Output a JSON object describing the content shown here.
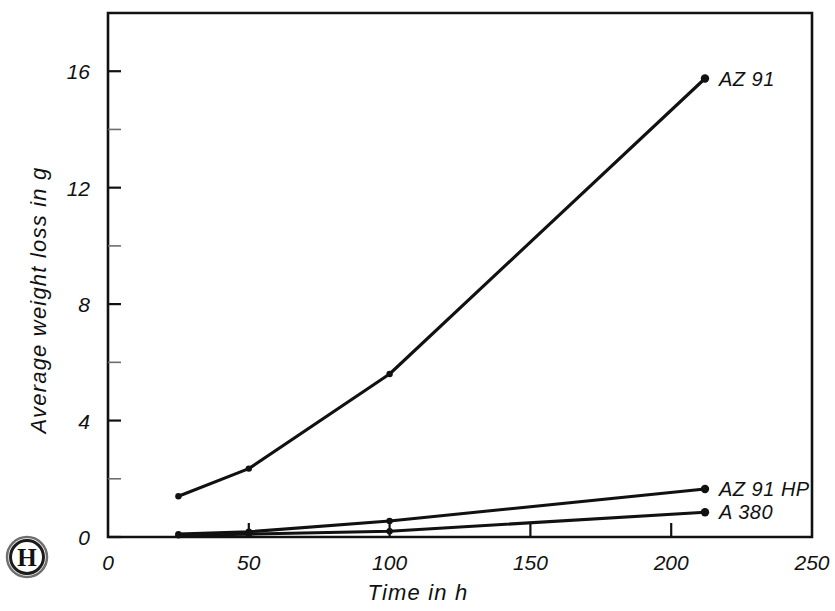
{
  "figure": {
    "background_color": "#ffffff",
    "ink_color": "#111111",
    "logo": {
      "name": "publisher-monogram",
      "letter": "H"
    }
  },
  "axes": {
    "x": {
      "title": "Time  in  h",
      "ticks": [
        "0",
        "50",
        "100",
        "150",
        "200",
        "250"
      ],
      "tick_values": [
        0,
        50,
        100,
        150,
        200,
        250
      ],
      "range": [
        0,
        250
      ]
    },
    "y": {
      "title": "Average  weight  loss  in  g",
      "ticks": [
        "0",
        "4",
        "8",
        "12",
        "16"
      ],
      "tick_values": [
        0,
        4,
        8,
        12,
        16
      ],
      "minor_tick_values": [
        2,
        6,
        10,
        14
      ],
      "range": [
        0,
        18
      ]
    }
  },
  "chart_data": {
    "type": "line",
    "title": "",
    "subtitle": "",
    "xlabel": "Time  in  h",
    "ylabel": "Average  weight  loss  in  g",
    "xlim": [
      0,
      250
    ],
    "ylim": [
      0,
      18
    ],
    "grid": false,
    "legend_position": "right-of-line-ends",
    "series": [
      {
        "name": "AZ 91",
        "label": "AZ 91",
        "color": "#111111",
        "x": [
          25,
          50,
          100,
          212
        ],
        "values": [
          1.4,
          2.35,
          5.6,
          15.75
        ]
      },
      {
        "name": "AZ 91 HP",
        "label": "AZ 91 HP",
        "color": "#111111",
        "x": [
          25,
          50,
          100,
          212
        ],
        "values": [
          0.1,
          0.18,
          0.55,
          1.65
        ]
      },
      {
        "name": "A 380",
        "label": "A 380",
        "color": "#111111",
        "x": [
          25,
          50,
          100,
          212
        ],
        "values": [
          0.06,
          0.1,
          0.2,
          0.85
        ]
      }
    ]
  }
}
